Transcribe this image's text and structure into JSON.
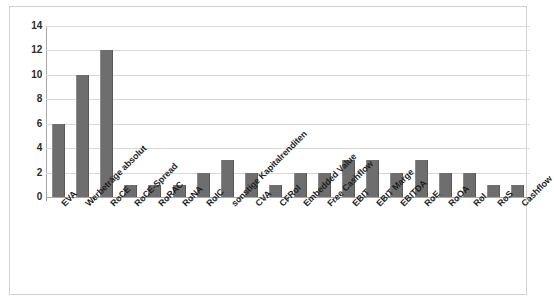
{
  "chart_data": {
    "type": "bar",
    "title": "",
    "xlabel": "",
    "ylabel": "",
    "ylim": [
      0,
      14
    ],
    "yticks": [
      0,
      2,
      4,
      6,
      8,
      10,
      12,
      14
    ],
    "grid": true,
    "legend": false,
    "bar_color": "#6e6e6e",
    "categories": [
      "EVA",
      "Werbeträge absolut",
      "RoCE",
      "RoCE-Spread",
      "RoRAC",
      "RoNA",
      "RoIC",
      "sonstige Kapitalrenditen",
      "CVA",
      "CFRoI",
      "Embedded Value",
      "Free Cashflow",
      "EBIT",
      "EBIT Marge",
      "EBITDA",
      "RoE",
      "RoOA",
      "RoI",
      "RoS",
      "Cashflow"
    ],
    "values": [
      6,
      10,
      12,
      1,
      1,
      1,
      2,
      3,
      2,
      1,
      2,
      2,
      3,
      3,
      2,
      3,
      2,
      2,
      1,
      1
    ]
  }
}
